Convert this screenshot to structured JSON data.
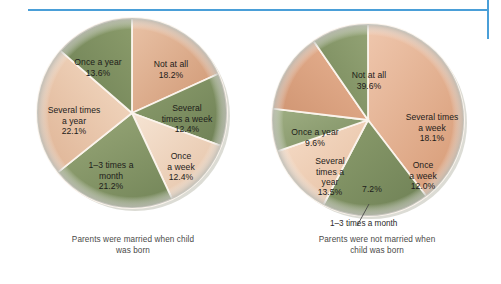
{
  "figure": {
    "background_color": "#ffffff",
    "rule_color": "#4a9fd8"
  },
  "palette": {
    "green_dark": "#7b8d5e",
    "green_light": "#9aa87c",
    "salmon_dark": "#c8906a",
    "salmon_light": "#e8c5ae",
    "cream": "#f0ddcb",
    "olive": "#8b9a6b",
    "rim": "#cfcfc8"
  },
  "chart_data": [
    {
      "type": "pie",
      "id": "married",
      "title": "Parents were married when child\nwas born",
      "categories": [
        "Not at all",
        "Several times a week",
        "Once a week",
        "1–3 times a month",
        "Several times a year",
        "Once a year"
      ],
      "values": [
        18.2,
        12.4,
        12.4,
        21.2,
        22.1,
        13.6
      ],
      "labels": [
        "18.2%",
        "12.4%",
        "12.4%",
        "21.2%",
        "22.1%",
        "13.6%"
      ],
      "start_angle_deg": 0,
      "direction": "clockwise",
      "slice_colors": [
        "#e0b194",
        "#7f9164",
        "#efd8c3",
        "#8a9a6a",
        "#eccfb7",
        "#7e8f5d"
      ],
      "legend": "none",
      "grid": false
    },
    {
      "type": "pie",
      "id": "not-married",
      "title": "Parents were not married when\nchild was born",
      "categories": [
        "Not at all",
        "Several times a week",
        "Once a week",
        "1–3 times a month",
        "Several times a year",
        "Once a year"
      ],
      "values": [
        39.6,
        18.1,
        12.0,
        7.2,
        13.5,
        9.6
      ],
      "labels": [
        "39.6%",
        "18.1%",
        "12.0%",
        "7.2%",
        "13.5%",
        "9.6%"
      ],
      "start_angle_deg": 0,
      "direction": "clockwise",
      "slice_colors": [
        "#e3a886",
        "#7f9164",
        "#eec9ae",
        "#93a377",
        "#dda685",
        "#8a9a6a"
      ],
      "legend": "none",
      "grid": false
    }
  ],
  "left_chart": {
    "caption": "Parents were married when child\nwas born",
    "slices": [
      {
        "name": "not-at-all",
        "text": "Not at all",
        "pct": "18.2%"
      },
      {
        "name": "several-week",
        "text": "Several\ntimes a week",
        "pct": "12.4%"
      },
      {
        "name": "once-week",
        "text": "Once\na week",
        "pct": "12.4%"
      },
      {
        "name": "one-three-month",
        "text": "1–3 times a\nmonth",
        "pct": "21.2%"
      },
      {
        "name": "several-year",
        "text": "Several times\na year",
        "pct": "22.1%"
      },
      {
        "name": "once-year",
        "text": "Once a year",
        "pct": "13.6%"
      }
    ]
  },
  "right_chart": {
    "caption": "Parents were not married when\nchild was born",
    "callout": "1–3 times a month",
    "slices": [
      {
        "name": "not-at-all",
        "text": "Not at all",
        "pct": "39.6%"
      },
      {
        "name": "several-week",
        "text": "Several times\na week",
        "pct": "18.1%"
      },
      {
        "name": "once-week",
        "text": "Once\na week",
        "pct": "12.0%"
      },
      {
        "name": "one-three-month",
        "text": "",
        "pct": "7.2%"
      },
      {
        "name": "several-year",
        "text": "Several\ntimes a\nyear",
        "pct": "13.5%"
      },
      {
        "name": "once-year",
        "text": "Once a year",
        "pct": "9.6%"
      }
    ]
  }
}
